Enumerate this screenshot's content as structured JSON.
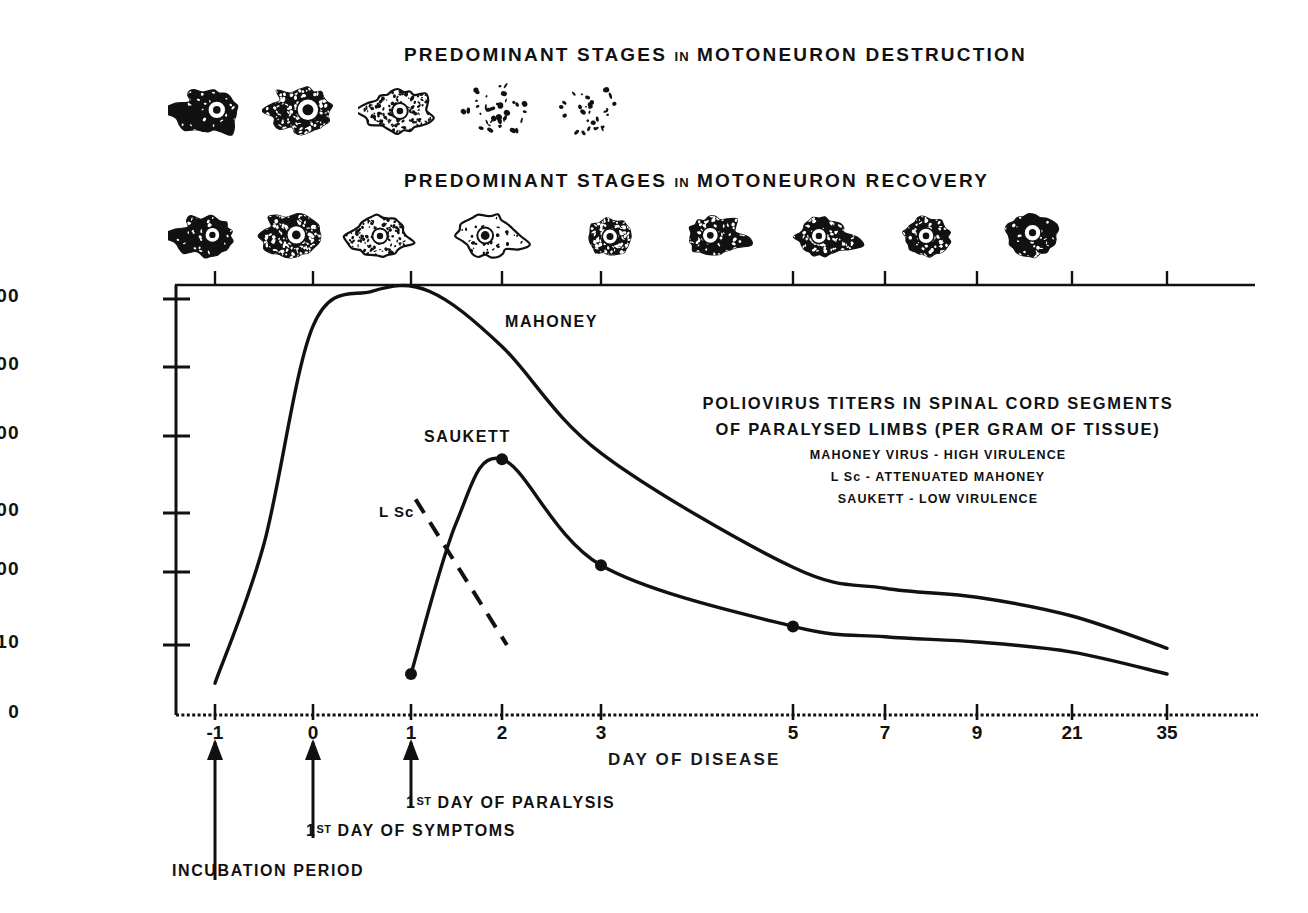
{
  "headers": {
    "destruction": {
      "pre": "PREDOMINANT  STAGES",
      "in": "IN",
      "post": "MOTONEURON  DESTRUCTION"
    },
    "recovery": {
      "pre": "PREDOMINANT  STAGES",
      "in": "IN",
      "post": "MOTONEURON  RECOVERY"
    }
  },
  "legend": {
    "line1": "POLIOVIRUS  TITERS  IN  SPINAL  CORD  SEGMENTS",
    "line2": "OF  PARALYSED  LIMBS  (PER  GRAM  OF  TISSUE)",
    "sub1": "MAHONEY VIRUS - HIGH VIRULENCE",
    "sub2": "L Sc - ATTENUATED MAHONEY",
    "sub3": "SAUKETT - LOW VIRULENCE"
  },
  "curve_labels": {
    "mahoney": "MAHONEY",
    "saukett": "SAUKETT",
    "lsc": "L Sc"
  },
  "annotations": {
    "paralysis_sup": "ST",
    "paralysis_num": "1",
    "paralysis_text": " DAY OF PARALYSIS",
    "symptoms_sup": "ST",
    "symptoms_num": "1",
    "symptoms_text": " DAY  OF  SYMPTOMS",
    "incubation": "INCUBATION  PERIOD"
  },
  "axes": {
    "x_title": "DAY  OF  DISEASE",
    "y_ticks": [
      "1,000,000",
      "100,000",
      "10,000",
      "1,000",
      "100",
      "10",
      "0"
    ],
    "x_ticks": [
      "-1",
      "0",
      "1",
      "2",
      "3",
      "5",
      "7",
      "9",
      "21",
      "35"
    ]
  },
  "cells": {
    "destruction_count": 5,
    "recovery_count": 9,
    "destruction_stages": [
      "intact-motoneuron",
      "chromatolytic-motoneuron",
      "severe-chromatolysis",
      "fragmenting-debris",
      "scattered-debris"
    ],
    "recovery_stages": [
      "intact-motoneuron",
      "early-chromatolysis",
      "pale-chromatolysis",
      "ghost-cell",
      "small-recovering",
      "recovering-process",
      "recovering-irregular",
      "recovering-round",
      "restored-motoneuron"
    ]
  },
  "colors": {
    "ink": "#111111",
    "background": "#ffffff"
  },
  "chart_data": {
    "type": "line",
    "title": "POLIOVIRUS  TITERS  IN  SPINAL  CORD  SEGMENTS OF  PARALYSED  LIMBS  (PER  GRAM  OF  TISSUE)",
    "xlabel": "DAY  OF  DISEASE",
    "ylabel": "",
    "x_tick_labels": [
      "-1",
      "0",
      "1",
      "2",
      "3",
      "5",
      "7",
      "9",
      "21",
      "35"
    ],
    "y_tick_labels": [
      "1,000,000",
      "100,000",
      "10,000",
      "1,000",
      "100",
      "10",
      "0"
    ],
    "y_scale": "log",
    "ylim": [
      1,
      1000000
    ],
    "grid": false,
    "legend_position": "inside-right",
    "series": [
      {
        "name": "MAHONEY",
        "style": "solid",
        "description": "High virulence; rises from day -1, plateaus near 1,000,000 around day 0-1, declines through day 35",
        "points": [
          {
            "x": -1,
            "y": 3
          },
          {
            "x": -0.5,
            "y": 300
          },
          {
            "x": 0,
            "y": 400000
          },
          {
            "x": 0.6,
            "y": 1300000
          },
          {
            "x": 1.2,
            "y": 1300000
          },
          {
            "x": 2,
            "y": 200000
          },
          {
            "x": 3,
            "y": 6000
          },
          {
            "x": 5,
            "y": 120
          },
          {
            "x": 7,
            "y": 60
          },
          {
            "x": 9,
            "y": 45
          },
          {
            "x": 21,
            "y": 25
          },
          {
            "x": 35,
            "y": 9
          }
        ]
      },
      {
        "name": "SAUKETT",
        "style": "solid",
        "markers": true,
        "description": "Low virulence; rises from day 1 to a peak near 5,000 at day 2, then declines",
        "points": [
          {
            "x": 1,
            "y": 4
          },
          {
            "x": 1.5,
            "y": 700
          },
          {
            "x": 2,
            "y": 5000
          },
          {
            "x": 3,
            "y": 130
          },
          {
            "x": 5,
            "y": 18
          },
          {
            "x": 7,
            "y": 13
          },
          {
            "x": 9,
            "y": 11
          },
          {
            "x": 21,
            "y": 8
          },
          {
            "x": 35,
            "y": 4
          }
        ],
        "marker_points": [
          {
            "x": 1,
            "y": 4
          },
          {
            "x": 2,
            "y": 5000
          },
          {
            "x": 3,
            "y": 130
          },
          {
            "x": 5,
            "y": 18
          }
        ]
      },
      {
        "name": "L Sc",
        "style": "dashed",
        "description": "Attenuated Mahoney; short dashed segment declining from about 1,500 to 10 between day 1 and day 2",
        "points": [
          {
            "x": 1.05,
            "y": 1500
          },
          {
            "x": 2.05,
            "y": 10
          }
        ]
      }
    ],
    "annotations": [
      {
        "text": "INCUBATION  PERIOD",
        "x": -1,
        "type": "arrow-up"
      },
      {
        "text": "1ST DAY  OF  SYMPTOMS",
        "x": 0,
        "type": "arrow-up"
      },
      {
        "text": "1ST DAY OF PARALYSIS",
        "x": 1,
        "type": "arrow-up"
      }
    ]
  }
}
